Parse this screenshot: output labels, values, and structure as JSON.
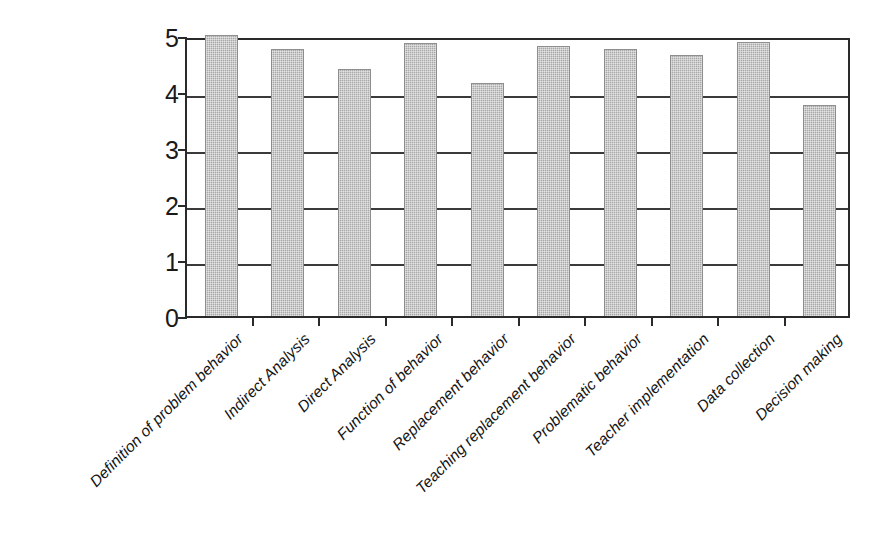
{
  "chart_data": {
    "type": "bar",
    "title": "",
    "subtitle": "",
    "xlabel": "",
    "ylabel": "",
    "ylim": [
      0,
      5
    ],
    "yticks": [
      0,
      1,
      2,
      3,
      4,
      5
    ],
    "ytick_labels": [
      "0",
      "1",
      "2",
      "3",
      "4",
      "5"
    ],
    "grid": true,
    "grid_axis": "y",
    "legend": false,
    "legend_position": "none",
    "bar_color": "#a8a8a8",
    "axis_color": "#2a2a2a",
    "categories": [
      "Definition of problem behavior",
      "Indirect Analysis",
      "Direct Analysis",
      "Function of behavior",
      "Replacement behavior",
      "Teaching replacement behavior",
      "Problematic behavior",
      "Teacher implementation",
      "Data collection",
      "Decision making"
    ],
    "values": [
      5.0,
      4.75,
      4.4,
      4.85,
      4.15,
      4.8,
      4.75,
      4.65,
      4.88,
      3.75
    ]
  }
}
